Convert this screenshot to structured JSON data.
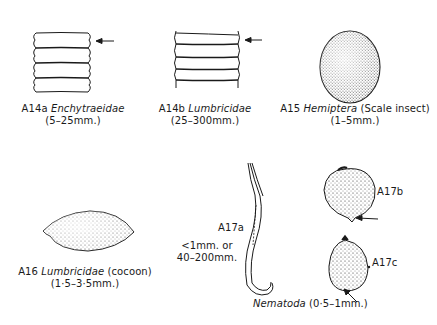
{
  "figures": [
    {
      "id": "A14a",
      "taxon": "Enchytraeidae",
      "note": "",
      "size": "(5–25mm.)"
    },
    {
      "id": "A14b",
      "taxon": "Lumbricidae",
      "note": "",
      "size": "(25–300mm.)"
    },
    {
      "id": "A15",
      "taxon": "Hemiptera",
      "note": "(Scale insect)",
      "size": "(1–5mm.)"
    },
    {
      "id": "A16",
      "taxon": "Lumbricidae",
      "note": "(cocoon)",
      "size": "(1·5–3·5mm.)"
    },
    {
      "id": "A17a",
      "taxon": "",
      "note": "",
      "size_line1": "<1mm. or",
      "size_line2": "40–200mm."
    },
    {
      "id": "A17b",
      "taxon": "",
      "note": "",
      "size": ""
    },
    {
      "id": "A17c",
      "taxon": "",
      "note": "",
      "size": ""
    }
  ],
  "nematoda_caption": {
    "taxon": "Nematoda",
    "size": "(0·5–1mm.)"
  },
  "colors": {
    "ink": "#1a1a1a",
    "background": "#ffffff"
  }
}
